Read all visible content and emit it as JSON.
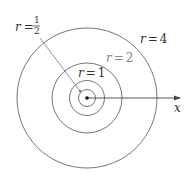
{
  "diagram": {
    "type": "concentric circles (polar coordinate curves r = constant)",
    "center": {
      "label": "origin"
    },
    "circles": [
      {
        "label_var": "r",
        "label_eq": "=",
        "label_value": "1/2",
        "num": "1",
        "den": "2"
      },
      {
        "label_var": "r",
        "label_eq": "=",
        "label_value": "1"
      },
      {
        "label_var": "r",
        "label_eq": "=",
        "label_value": "2"
      },
      {
        "label_var": "r",
        "label_eq": "=",
        "label_value": "4"
      }
    ],
    "axis": {
      "label": "x"
    },
    "colors": {
      "stroke": "#555555",
      "label": "#333333",
      "faint_label": "#888888"
    }
  }
}
